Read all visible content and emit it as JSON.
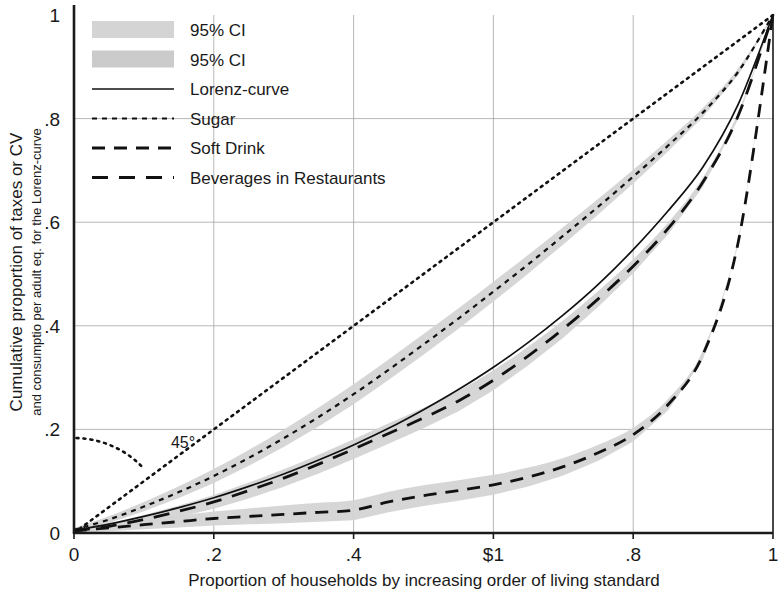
{
  "chart_data": {
    "type": "line",
    "title": "",
    "xlabel": "Proportion of households by increasing order of living standard",
    "ylabel_line1": "Cumulative proportion of taxes or CV",
    "ylabel_line2": "and consumptio per adult eq. for the Lorenz-curve",
    "xlim": [
      0,
      1
    ],
    "ylim": [
      0,
      1
    ],
    "grid": true,
    "xticks": [
      0,
      0.2,
      0.4,
      0.6,
      0.8,
      1
    ],
    "xtick_labels": [
      "0",
      ".2",
      ".4",
      "$1",
      ".8",
      "1"
    ],
    "yticks": [
      0,
      0.2,
      0.4,
      0.6,
      0.8,
      1
    ],
    "ytick_labels": [
      "0",
      ".2",
      ".4",
      ".6",
      ".8",
      "1"
    ],
    "legend_position": "top-left",
    "annotations": [
      {
        "name": "angle-45",
        "text": "45°",
        "x": 0.09,
        "y": 0.175
      }
    ],
    "series": [
      {
        "name": "45-degree line",
        "style": "dotted",
        "color": "#111111",
        "x": [
          0,
          1
        ],
        "values": [
          0,
          1
        ]
      },
      {
        "name": "Lorenz-curve",
        "style": "solid",
        "color": "#111111",
        "x": [
          0,
          0.05,
          0.1,
          0.15,
          0.2,
          0.25,
          0.3,
          0.35,
          0.4,
          0.45,
          0.5,
          0.55,
          0.6,
          0.65,
          0.7,
          0.75,
          0.8,
          0.85,
          0.9,
          0.95,
          1.0
        ],
        "values": [
          0.005,
          0.017,
          0.032,
          0.049,
          0.068,
          0.09,
          0.114,
          0.141,
          0.17,
          0.202,
          0.238,
          0.277,
          0.32,
          0.368,
          0.421,
          0.48,
          0.547,
          0.622,
          0.707,
          0.827,
          1.0
        ]
      },
      {
        "name": "Sugar",
        "style": "dashed-fine",
        "color": "#111111",
        "x": [
          0,
          0.05,
          0.1,
          0.15,
          0.2,
          0.25,
          0.3,
          0.35,
          0.4,
          0.45,
          0.5,
          0.55,
          0.6,
          0.65,
          0.7,
          0.75,
          0.8,
          0.85,
          0.9,
          0.95,
          1.0
        ],
        "values": [
          0.006,
          0.026,
          0.051,
          0.079,
          0.11,
          0.145,
          0.183,
          0.224,
          0.268,
          0.315,
          0.364,
          0.414,
          0.466,
          0.519,
          0.574,
          0.63,
          0.688,
          0.748,
          0.812,
          0.89,
          1.0
        ],
        "ci": true
      },
      {
        "name": "Soft Drink",
        "style": "dashed-long",
        "color": "#111111",
        "x": [
          0,
          0.05,
          0.1,
          0.15,
          0.2,
          0.25,
          0.3,
          0.35,
          0.4,
          0.45,
          0.5,
          0.55,
          0.6,
          0.65,
          0.7,
          0.75,
          0.8,
          0.85,
          0.9,
          0.95,
          1.0
        ],
        "values": [
          0.004,
          0.01,
          0.016,
          0.022,
          0.028,
          0.032,
          0.036,
          0.04,
          0.044,
          0.06,
          0.072,
          0.082,
          0.093,
          0.108,
          0.128,
          0.155,
          0.19,
          0.248,
          0.345,
          0.56,
          1.0
        ],
        "ci": true
      },
      {
        "name": "Beverages in Restaurants",
        "style": "dashed-medium",
        "color": "#111111",
        "x": [
          0,
          0.05,
          0.1,
          0.15,
          0.2,
          0.25,
          0.3,
          0.35,
          0.4,
          0.45,
          0.5,
          0.55,
          0.6,
          0.65,
          0.7,
          0.75,
          0.8,
          0.85,
          0.9,
          0.95,
          1.0
        ],
        "values": [
          0.004,
          0.013,
          0.026,
          0.042,
          0.06,
          0.082,
          0.106,
          0.133,
          0.162,
          0.192,
          0.222,
          0.255,
          0.295,
          0.342,
          0.394,
          0.452,
          0.515,
          0.588,
          0.678,
          0.805,
          1.0
        ],
        "ci": true
      }
    ]
  },
  "legend": {
    "items": [
      {
        "label": "95% CI",
        "style": "band"
      },
      {
        "label": "95% CI",
        "style": "band"
      },
      {
        "label": "Lorenz-curve",
        "style": "solid"
      },
      {
        "label": "Sugar",
        "style": "dashed-fine"
      },
      {
        "label": "Soft Drink",
        "style": "dashed-long"
      },
      {
        "label": "Beverages in Restaurants",
        "style": "dashed-medium"
      }
    ]
  },
  "colors": {
    "axis": "#1a1a1a",
    "grid": "#999999",
    "line": "#111111",
    "ci_band_1": "#d4d4d4",
    "ci_band_2": "#cbcbcb",
    "background": "#ffffff"
  }
}
